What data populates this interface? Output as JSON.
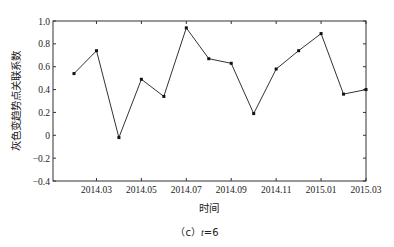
{
  "chart_data": {
    "type": "line",
    "title": "",
    "xlabel": "时间",
    "ylabel": "灰色变趋势点关联系数",
    "caption_prefix": "（c）",
    "caption_var": "t",
    "caption_value": "=6",
    "x": [
      "2014.02",
      "2014.03",
      "2014.04",
      "2014.05",
      "2014.06",
      "2014.07",
      "2014.08",
      "2014.09",
      "2014.10",
      "2014.11",
      "2014.12",
      "2015.01",
      "2015.02",
      "2015.03"
    ],
    "series": [
      {
        "name": "灰色变趋势点关联系数",
        "values": [
          0.54,
          0.74,
          -0.02,
          0.49,
          0.34,
          0.94,
          0.67,
          0.63,
          0.19,
          0.58,
          0.74,
          0.89,
          0.36,
          0.4
        ]
      }
    ],
    "xticks": [
      "2014.03",
      "2014.05",
      "2014.07",
      "2014.09",
      "2014.11",
      "2015.01",
      "2015.03"
    ],
    "yticks": [
      "1.0",
      "0.8",
      "0.6",
      "0.4",
      "0.2",
      "0",
      "-0.2",
      "-0.4"
    ],
    "ylim": [
      -0.4,
      1.0
    ],
    "grid": false,
    "legend": "none",
    "colors": {
      "line": "#333333",
      "marker": "#111111",
      "axis": "#333333"
    }
  }
}
